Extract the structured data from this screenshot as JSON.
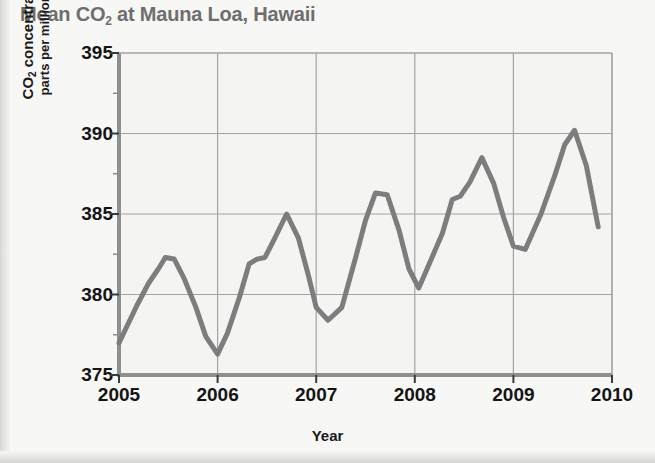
{
  "chart_data": {
    "type": "line",
    "title": "Mean CO2 at Mauna Loa, Hawaii",
    "title_prefix": "Mean CO",
    "title_sub": "2",
    "title_suffix": " at Mauna Loa, Hawaii",
    "xlabel": "Year",
    "ylabel_line1_prefix": "CO",
    "ylabel_line1_sub": "2",
    "ylabel_line1_suffix": " concentration in",
    "ylabel_line2": "parts per million (ppm)",
    "ylabel": "CO2 concentration in parts per million (ppm)",
    "xlim": [
      2005,
      2010
    ],
    "ylim": [
      375,
      395
    ],
    "xticks": [
      "2005",
      "2006",
      "2007",
      "2008",
      "2009",
      "2010"
    ],
    "yticks": [
      "375",
      "380",
      "385",
      "390",
      "395"
    ],
    "xtick_values": [
      2005,
      2006,
      2007,
      2008,
      2009,
      2010
    ],
    "ytick_values": [
      375,
      380,
      385,
      390,
      395
    ],
    "grid": true,
    "minor_y_ticks": [
      377.5,
      382.5,
      387.5,
      392.5
    ],
    "legend": "none",
    "series": [
      {
        "name": "Mean CO2 concentration",
        "color": "#7d7d7d",
        "x": [
          2005.0,
          2005.18,
          2005.3,
          2005.4,
          2005.47,
          2005.56,
          2005.66,
          2005.78,
          2005.88,
          2006.0,
          2006.1,
          2006.22,
          2006.32,
          2006.4,
          2006.48,
          2006.58,
          2006.7,
          2006.82,
          2006.92,
          2007.0,
          2007.12,
          2007.26,
          2007.4,
          2007.5,
          2007.6,
          2007.72,
          2007.84,
          2007.94,
          2008.04,
          2008.16,
          2008.28,
          2008.38,
          2008.46,
          2008.56,
          2008.68,
          2008.8,
          2008.9,
          2009.0,
          2009.12,
          2009.28,
          2009.42,
          2009.52,
          2009.62,
          2009.74,
          2009.86
        ],
        "y": [
          377.0,
          379.3,
          380.7,
          381.6,
          382.3,
          382.2,
          381.0,
          379.2,
          377.4,
          376.3,
          377.6,
          379.8,
          381.9,
          382.2,
          382.3,
          383.5,
          385.0,
          383.5,
          381.2,
          379.2,
          378.4,
          379.2,
          382.3,
          384.6,
          386.3,
          386.2,
          384.0,
          381.6,
          380.4,
          382.1,
          383.8,
          385.9,
          386.1,
          387.0,
          388.5,
          386.9,
          384.8,
          383.0,
          382.8,
          385.0,
          387.4,
          389.3,
          390.2,
          388.0,
          384.2
        ]
      }
    ]
  },
  "axes": {
    "plot_left_px": 119,
    "plot_right_px": 612,
    "plot_top_px": 53,
    "plot_bottom_px": 375
  },
  "colors": {
    "line": "#7d7d7d",
    "grid": "#a3a3a3",
    "axis": "#8f8f8f",
    "title_text": "#6e6e6e",
    "label_text": "#141414",
    "background": "#f7f7f5"
  }
}
